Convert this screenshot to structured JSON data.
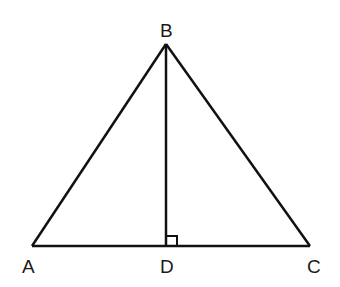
{
  "diagram": {
    "type": "geometry",
    "stroke_color": "#111111",
    "points": {
      "A": {
        "label": "A",
        "x": 32,
        "y": 246
      },
      "B": {
        "label": "B",
        "x": 166,
        "y": 44
      },
      "C": {
        "label": "C",
        "x": 310,
        "y": 246
      },
      "D": {
        "label": "D",
        "x": 166,
        "y": 246
      }
    },
    "segments": [
      "AB",
      "BC",
      "AC",
      "BD"
    ],
    "right_angle_marker": {
      "at": "D",
      "between": [
        "BD",
        "DC"
      ]
    }
  }
}
